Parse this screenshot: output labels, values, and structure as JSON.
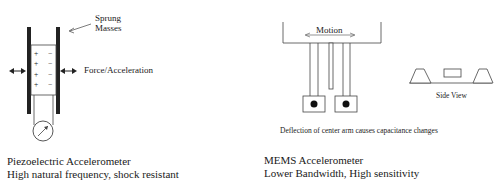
{
  "piezo": {
    "sprung_label_line1": "Sprung",
    "sprung_label_line2": "Masses",
    "force_label": "Force/Acceleration",
    "plus_signs": [
      "+",
      "+",
      "+",
      "+"
    ],
    "minus_signs": [
      "−",
      "−",
      "−",
      "−"
    ],
    "title": "Piezoelectric Accelerometer",
    "subtitle": "High natural frequency, shock resistant"
  },
  "mems": {
    "motion_label": "Motion",
    "side_view_label": "Side View",
    "deflection_caption": "Deflection of center arm causes capacitance changes",
    "title": "MEMS Accelerometer",
    "subtitle": "Lower Bandwidth, High sensitivity"
  },
  "icons": {
    "gauge": "gauge-icon",
    "double_arrow": "double-arrow-icon"
  }
}
